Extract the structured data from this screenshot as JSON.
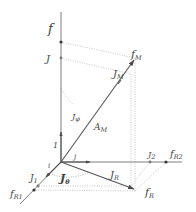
{
  "diagram": {
    "title": "",
    "axes": {
      "vertical": {
        "label": "f"
      },
      "right": {
        "label": "f",
        "sub": "R2"
      },
      "left": {
        "label": "f",
        "sub": "R1"
      }
    },
    "labels": {
      "f": {
        "main": "f"
      },
      "J": {
        "main": "J"
      },
      "fM": {
        "main": "f",
        "sub": "M"
      },
      "JM": {
        "main": "J",
        "sub": "M"
      },
      "Jphi": {
        "main": "J",
        "sub": "φ"
      },
      "AM": {
        "main": "A",
        "sub": "M"
      },
      "one": {
        "main": "1"
      },
      "i": {
        "main": "i"
      },
      "j": {
        "main": "j"
      },
      "J1": {
        "main": "J",
        "sub": "1"
      },
      "Jtheta": {
        "main": "J",
        "sub": "θ"
      },
      "JR": {
        "main": "J",
        "sub": "R"
      },
      "fR": {
        "main": "f",
        "sub": "R"
      },
      "J2": {
        "main": "J",
        "sub": "2"
      },
      "fR2": {
        "main": "f",
        "sub": "R2"
      },
      "fR1": {
        "main": "f",
        "sub": "R1"
      }
    },
    "colors": {
      "axis": "#6e6e6e",
      "vector": "#555555",
      "dotted": "#b9b9b9",
      "text": "#444444"
    }
  }
}
